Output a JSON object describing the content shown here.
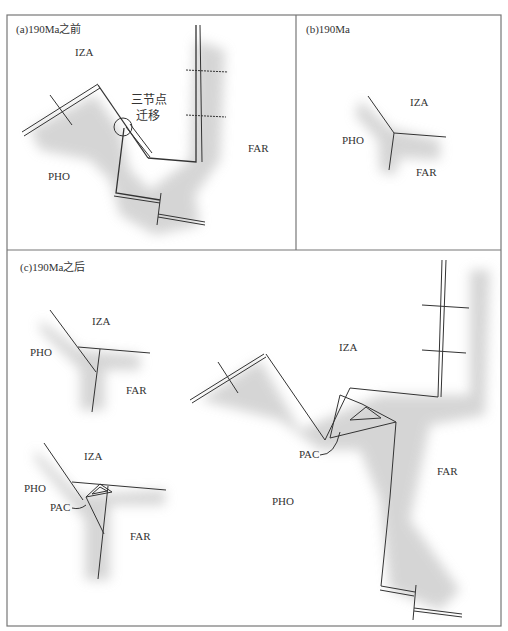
{
  "panels": {
    "a": {
      "title": "(a)190Ma之前",
      "labels": {
        "iza": "IZA",
        "far": "FAR",
        "pho": "PHO"
      },
      "annotation_line1": "三节点",
      "annotation_line2": "迁移"
    },
    "b": {
      "title": "(b)190Ma",
      "labels": {
        "iza": "IZA",
        "far": "FAR",
        "pho": "PHO"
      }
    },
    "c": {
      "title": "(c)190Ma之后",
      "upper_left": {
        "iza": "IZA",
        "far": "FAR",
        "pho": "PHO"
      },
      "lower_left": {
        "iza": "IZA",
        "far": "FAR",
        "pho": "PHO",
        "pac": "PAC"
      },
      "main": {
        "iza": "IZA",
        "far": "FAR",
        "pho": "PHO",
        "pac": "PAC"
      }
    }
  },
  "colors": {
    "line": "#333333",
    "frame": "#777777",
    "shade": "#c8c8c8"
  }
}
